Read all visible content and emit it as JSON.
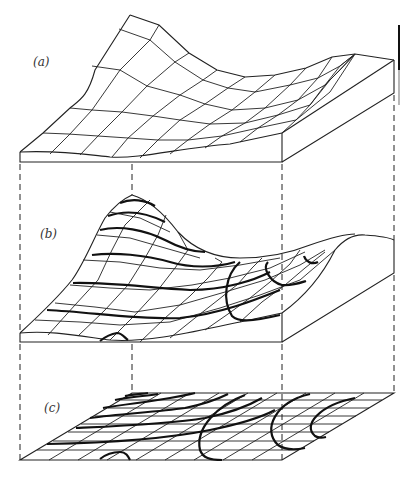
{
  "figure": {
    "panels": [
      {
        "id": "a",
        "label": "(a)",
        "content": "wireframe surface block"
      },
      {
        "id": "b",
        "label": "(b)",
        "content": "surface with contour lines"
      },
      {
        "id": "c",
        "label": "(c)",
        "content": "contour map projected on plane"
      }
    ],
    "colors": {
      "line": "#222222",
      "contour": "#111111",
      "background": "#ffffff"
    },
    "projection_lines": "dashed vertical lines connecting corners of panels a, b and c"
  }
}
